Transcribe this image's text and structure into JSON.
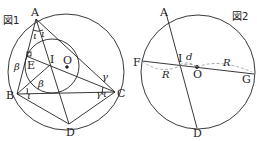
{
  "figure1": {
    "title": "図1",
    "points": {
      "A": "A",
      "B": "B",
      "C": "C",
      "D": "D",
      "E": "E",
      "I": "I",
      "O": "O"
    },
    "angles": {
      "iota_top_left": "ι",
      "iota_top_right": "ι",
      "beta_left": "β",
      "beta_inner": "β",
      "iota_b": "ι",
      "gamma_c_upper": "γ",
      "gamma_c_lower": "γ",
      "iota_c": "ι"
    }
  },
  "figure2": {
    "title": "図2",
    "points": {
      "A": "A",
      "D": "D",
      "F": "F",
      "G": "G",
      "I": "I",
      "O": "O"
    },
    "lengths": {
      "d": "d",
      "R_left": "R",
      "R_right": "R"
    }
  },
  "colors": {
    "stroke": "#222222",
    "dashed": "#888888",
    "background": "#ffffff"
  }
}
